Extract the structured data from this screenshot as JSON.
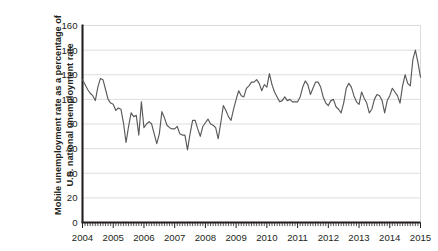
{
  "chart_data": {
    "type": "line",
    "title": "",
    "xlabel": "",
    "ylabel": "Mobile unemployment rate as a percentage of U.S. national unemployment rate",
    "ylim": [
      0,
      160
    ],
    "ytick_step": 20,
    "yticks": [
      "0",
      "20",
      "40",
      "60",
      "80",
      "100",
      "120",
      "140",
      "160"
    ],
    "xlim": [
      "2004",
      "2015"
    ],
    "xticks": [
      "2004",
      "2005",
      "2006",
      "2007",
      "2008",
      "2009",
      "2010",
      "2011",
      "2012",
      "2013",
      "2014",
      "2015"
    ],
    "grid": "horizontal",
    "legend": "none",
    "line_color": "#58595b",
    "axis_color": "#231f20",
    "grid_color": "#d9d9d9",
    "minor_tick_interval": "monthly",
    "x_start_decimal": 2004.0,
    "x_step_decimal": 0.08333,
    "series": [
      {
        "name": "Mobile unemployment rate as a percentage of U.S. national unemployment rate",
        "values": [
          116,
          112,
          108,
          105,
          103,
          99,
          110,
          117,
          116,
          108,
          100,
          97,
          96,
          91,
          93,
          92,
          81,
          65,
          78,
          89,
          86,
          87,
          71,
          98,
          77,
          80,
          82,
          80,
          72,
          64,
          72,
          90,
          85,
          79,
          77,
          76,
          76,
          78,
          72,
          71,
          71,
          59,
          72,
          83,
          83,
          76,
          70,
          78,
          81,
          84,
          80,
          79,
          77,
          68,
          81,
          95,
          91,
          86,
          83,
          92,
          100,
          107,
          103,
          102,
          109,
          111,
          114,
          114,
          116,
          113,
          107,
          112,
          110,
          121,
          112,
          106,
          102,
          98,
          99,
          102,
          99,
          100,
          98,
          98,
          98,
          102,
          110,
          115,
          112,
          104,
          109,
          114,
          114,
          110,
          102,
          97,
          95,
          99,
          100,
          94,
          92,
          89,
          97,
          109,
          113,
          110,
          103,
          98,
          96,
          106,
          101,
          97,
          89,
          92,
          100,
          104,
          103,
          99,
          89,
          99,
          103,
          109,
          106,
          103,
          97,
          111,
          120,
          113,
          111,
          132,
          140,
          130,
          118
        ]
      }
    ]
  }
}
